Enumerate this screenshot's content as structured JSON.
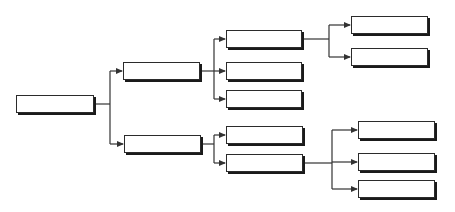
{
  "diagram": {
    "type": "tree-hierarchy",
    "line_color": "#333333",
    "box_border_color": "#2b2b2b",
    "box_shadow_color": "#1a1a1a",
    "background": "#ffffff",
    "nodes": [
      {
        "id": "root",
        "label": "",
        "x": 16,
        "y": 95,
        "w": 78,
        "h": 18
      },
      {
        "id": "a",
        "label": "",
        "x": 123,
        "y": 62,
        "w": 77,
        "h": 18
      },
      {
        "id": "b",
        "label": "",
        "x": 124,
        "y": 135,
        "w": 77,
        "h": 18
      },
      {
        "id": "a1",
        "label": "",
        "x": 226,
        "y": 30,
        "w": 76,
        "h": 18
      },
      {
        "id": "a2",
        "label": "",
        "x": 226,
        "y": 62,
        "w": 76,
        "h": 18
      },
      {
        "id": "a3",
        "label": "",
        "x": 226,
        "y": 90,
        "w": 76,
        "h": 18
      },
      {
        "id": "b1",
        "label": "",
        "x": 226,
        "y": 126,
        "w": 77,
        "h": 18
      },
      {
        "id": "b2",
        "label": "",
        "x": 226,
        "y": 154,
        "w": 77,
        "h": 18
      },
      {
        "id": "a1a",
        "label": "",
        "x": 351,
        "y": 16,
        "w": 77,
        "h": 18
      },
      {
        "id": "a1b",
        "label": "",
        "x": 351,
        "y": 48,
        "w": 77,
        "h": 18
      },
      {
        "id": "b2a",
        "label": "",
        "x": 358,
        "y": 121,
        "w": 77,
        "h": 18
      },
      {
        "id": "b2b",
        "label": "",
        "x": 358,
        "y": 153,
        "w": 77,
        "h": 18
      },
      {
        "id": "b2c",
        "label": "",
        "x": 358,
        "y": 180,
        "w": 77,
        "h": 18
      }
    ],
    "edges": [
      {
        "from": "root",
        "to": "a"
      },
      {
        "from": "root",
        "to": "b"
      },
      {
        "from": "a",
        "to": "a1"
      },
      {
        "from": "a",
        "to": "a2"
      },
      {
        "from": "a",
        "to": "a3"
      },
      {
        "from": "b",
        "to": "b1"
      },
      {
        "from": "b",
        "to": "b2"
      },
      {
        "from": "a1",
        "to": "a1a"
      },
      {
        "from": "a1",
        "to": "a1b"
      },
      {
        "from": "b2",
        "to": "b2a"
      },
      {
        "from": "b2",
        "to": "b2b"
      },
      {
        "from": "b2",
        "to": "b2c"
      }
    ]
  }
}
